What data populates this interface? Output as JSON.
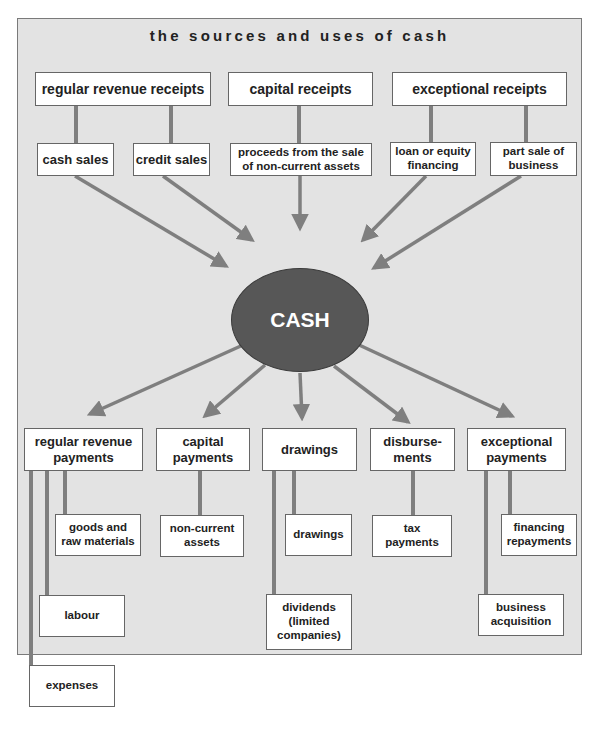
{
  "diagram": {
    "title": "the sources and uses of cash",
    "center": {
      "label": "CASH",
      "fill": "#575757",
      "text_color": "#ffffff"
    },
    "colors": {
      "background": "#e3e3e3",
      "connector": "#7f7f7f",
      "box_fill": "#ffffff",
      "box_border": "#666666"
    },
    "sources": [
      {
        "label": "regular revenue receipts",
        "children": [
          "cash sales",
          "credit sales"
        ]
      },
      {
        "label": "capital receipts",
        "children": [
          "proceeds from the sale\nof non-current assets"
        ]
      },
      {
        "label": "exceptional receipts",
        "children": [
          "loan or equity\nfinancing",
          "part sale of\nbusiness"
        ]
      }
    ],
    "uses": [
      {
        "label": "regular revenue\npayments",
        "children": [
          "goods and\nraw materials",
          "labour",
          "expenses"
        ]
      },
      {
        "label": "capital\npayments",
        "children": [
          "non-current\nassets"
        ]
      },
      {
        "label": "drawings",
        "children": [
          "drawings",
          "dividends\n(limited\ncompanies)"
        ]
      },
      {
        "label": "disburse-\nments",
        "children": [
          "tax\npayments"
        ]
      },
      {
        "label": "exceptional\npayments",
        "children": [
          "financing\nrepayments",
          "business\nacquisition"
        ]
      }
    ]
  }
}
